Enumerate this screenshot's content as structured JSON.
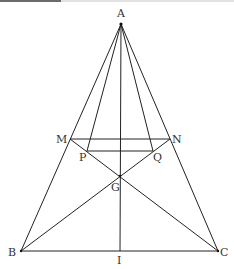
{
  "diagram": {
    "type": "geometry-figure",
    "stroke_color": "#222222",
    "label_color": "#333333",
    "points": {
      "A": {
        "label": "A",
        "x": 121,
        "y": 24,
        "lx": 117,
        "ly": 17
      },
      "M": {
        "label": "M",
        "x": 70,
        "y": 139,
        "lx": 56,
        "ly": 143
      },
      "N": {
        "label": "N",
        "x": 170,
        "y": 139,
        "lx": 172,
        "ly": 143
      },
      "P": {
        "label": "P",
        "x": 87,
        "y": 151,
        "lx": 79,
        "ly": 161
      },
      "Q": {
        "label": "Q",
        "x": 153,
        "y": 151,
        "lx": 153,
        "ly": 161
      },
      "G": {
        "label": "G",
        "x": 120,
        "y": 176,
        "lx": 111,
        "ly": 191
      },
      "B": {
        "label": "B",
        "x": 21,
        "y": 251,
        "lx": 8,
        "ly": 256
      },
      "C": {
        "label": "C",
        "x": 218,
        "y": 251,
        "lx": 220,
        "ly": 256
      },
      "I": {
        "label": "I",
        "x": 120,
        "y": 251,
        "lx": 117,
        "ly": 264
      }
    },
    "segments": [
      [
        "A",
        "B"
      ],
      [
        "A",
        "C"
      ],
      [
        "A",
        "P"
      ],
      [
        "A",
        "Q"
      ],
      [
        "A",
        "I"
      ],
      [
        "B",
        "C"
      ],
      [
        "M",
        "N"
      ],
      [
        "P",
        "Q"
      ],
      [
        "M",
        "C"
      ],
      [
        "N",
        "B"
      ]
    ]
  }
}
